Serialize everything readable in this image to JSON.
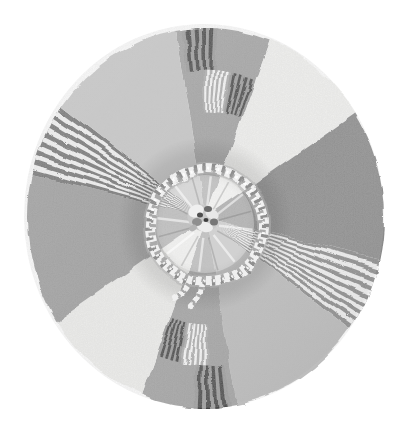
{
  "canvas": {
    "width": 405,
    "height": 428,
    "background": "#ffffff"
  },
  "wheel": {
    "cx": 204,
    "cy": 216,
    "rx": 178,
    "ry": 190,
    "sectors": [
      {
        "name": "wedge-top-plaid",
        "start": -10,
        "end": 21,
        "fill": "#a1a1a1"
      },
      {
        "name": "wedge-ne-white",
        "start": 21,
        "end": 57,
        "fill": "#f4f4f2"
      },
      {
        "name": "wedge-east-dark",
        "start": 57,
        "end": 103,
        "fill": "#8a8a8a"
      },
      {
        "name": "band-se-striped",
        "start": 103,
        "end": 126,
        "stripes": {
          "count": 17,
          "colors": [
            "#898989",
            "#f6f6f6"
          ]
        }
      },
      {
        "name": "wedge-south-light",
        "start": 126,
        "end": 170,
        "fill": "#bcbcbc"
      },
      {
        "name": "wedge-bottom-plaid",
        "start": 170,
        "end": 201,
        "fill": "#a1a1a1"
      },
      {
        "name": "wedge-sw-white",
        "start": 201,
        "end": 237,
        "fill": "#f0f0ee"
      },
      {
        "name": "wedge-west-gray",
        "start": 237,
        "end": 283,
        "fill": "#9c9c9c"
      },
      {
        "name": "band-nw-striped",
        "start": 283,
        "end": 306,
        "stripes": {
          "count": 15,
          "colors": [
            "#6f6f6f",
            "#f5f5f5"
          ]
        }
      },
      {
        "name": "wedge-nw-light",
        "start": 306,
        "end": 350,
        "fill": "#c7c7c7"
      }
    ],
    "blocks": [
      {
        "name": "block-top-rim-dark",
        "start": -8,
        "end": 4,
        "r0": 0.775,
        "r1": 1.0,
        "count": 9,
        "colors": [
          "#9a9a9a",
          "#424242"
        ]
      },
      {
        "name": "block-top-mid-white",
        "start": -1,
        "end": 11,
        "r0": 0.555,
        "r1": 0.775,
        "count": 11,
        "colors": [
          "#acacac",
          "#fafafa"
        ]
      },
      {
        "name": "block-top-mid-dark",
        "start": 11,
        "end": 21,
        "r0": 0.555,
        "r1": 0.775,
        "count": 9,
        "colors": [
          "#9a9a9a",
          "#424242"
        ]
      },
      {
        "name": "block-bottom-rim-dark",
        "start": 172,
        "end": 184,
        "r0": 0.775,
        "r1": 1.0,
        "count": 9,
        "colors": [
          "#9a9a9a",
          "#424242"
        ]
      },
      {
        "name": "block-bottom-mid-white",
        "start": 179,
        "end": 191,
        "r0": 0.555,
        "r1": 0.775,
        "count": 11,
        "colors": [
          "#acacac",
          "#fafafa"
        ]
      },
      {
        "name": "block-bottom-mid-dark",
        "start": 191,
        "end": 201,
        "r0": 0.555,
        "r1": 0.775,
        "count": 9,
        "colors": [
          "#9a9a9a",
          "#424242"
        ]
      }
    ]
  },
  "shading": {
    "hub_annulus_dark": "rgba(40,40,40,0.13)",
    "hub_inner_light": "rgba(255,255,255,0.30)",
    "light_from_topleft": "rgba(255,255,255,0.07)",
    "shade_to_bottomright": "rgba(0,0,0,0.06)"
  },
  "cord": {
    "cx": 205,
    "cy": 224,
    "r": 57,
    "width": 10,
    "base_color": "#f0f0f0",
    "twist_color": "#8f8f8f",
    "twist_color_2": "#9a9a9a",
    "edge_color": "#b2b2b2",
    "highlight_color": "#ffffff",
    "dash": "3.2 6.2",
    "highlight_dash": "2 7.4",
    "tails": [
      {
        "d": "M 187 282 q -7 11 -15 14"
      },
      {
        "d": "M 199 287 q -1 11 -9 17"
      }
    ]
  },
  "center_knot": {
    "streak_count": 16,
    "streak_color": "rgba(255,255,255,0.55)",
    "streak_dark": "rgba(80,80,80,0.22)",
    "blobs": [
      {
        "x": 203,
        "y": 218,
        "rx": 16,
        "ry": 13,
        "rot": 20,
        "fill": "#c9c9c9"
      },
      {
        "x": 196,
        "y": 211,
        "rx": 8,
        "ry": 6,
        "rot": -25,
        "fill": "#efefef"
      },
      {
        "x": 212,
        "y": 214,
        "rx": 7,
        "ry": 5,
        "rot": 30,
        "fill": "#e8e8e8"
      },
      {
        "x": 205,
        "y": 227,
        "rx": 8,
        "ry": 5,
        "rot": 10,
        "fill": "#ededed"
      },
      {
        "x": 197,
        "y": 222,
        "rx": 5,
        "ry": 4,
        "rot": 0,
        "fill": "#8f8f8f"
      },
      {
        "x": 208,
        "y": 209,
        "rx": 4,
        "ry": 3,
        "rot": 0,
        "fill": "#6b6b6b"
      },
      {
        "x": 214,
        "y": 222,
        "rx": 4,
        "ry": 3.5,
        "rot": 0,
        "fill": "#777777"
      },
      {
        "x": 200,
        "y": 215,
        "rx": 3,
        "ry": 2.5,
        "rot": 0,
        "fill": "#4e4e4e"
      },
      {
        "x": 206,
        "y": 220,
        "rx": 2.5,
        "ry": 2,
        "rot": 0,
        "fill": "#3e3e3e"
      },
      {
        "x": 193,
        "y": 228,
        "rx": 4,
        "ry": 3,
        "rot": -30,
        "fill": "#b5b5b5"
      }
    ]
  }
}
